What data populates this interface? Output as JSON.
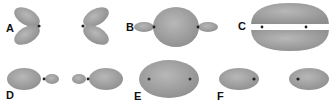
{
  "figure": {
    "panels": [
      {
        "label": "A",
        "description": "two p-orbital lobe pairs facing each other"
      },
      {
        "label": "B",
        "description": "sp bonding orbital with large central sphere"
      },
      {
        "label": "C",
        "description": "pi bonding orbital, upper and lower lobes"
      },
      {
        "label": "D",
        "description": "two sp hybrid orbitals pointing outward"
      },
      {
        "label": "E",
        "description": "sigma bonding orbital enclosing two nuclei"
      },
      {
        "label": "F",
        "description": "two separate s-like orbitals"
      }
    ],
    "colors": {
      "lobe": "#9c9c9c",
      "lobe_highlight": "#b8b8b8",
      "nucleus": "#222222"
    }
  }
}
